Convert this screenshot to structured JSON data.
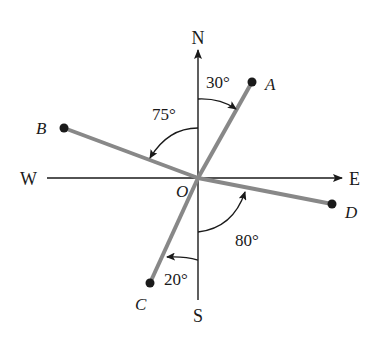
{
  "diagram": {
    "directions": {
      "north": "N",
      "south": "S",
      "east": "E",
      "west": "W"
    },
    "origin_label": "O",
    "points": [
      {
        "label": "A",
        "bearing": "N 30° E"
      },
      {
        "label": "B",
        "bearing": "N 75° W"
      },
      {
        "label": "C",
        "bearing": "S 20° W"
      },
      {
        "label": "D",
        "bearing": "S 80° E"
      }
    ],
    "angles": [
      {
        "id": "angle-a",
        "text": "30°"
      },
      {
        "id": "angle-b",
        "text": "75°"
      },
      {
        "id": "angle-c",
        "text": "20°"
      },
      {
        "id": "angle-d",
        "text": "80°"
      }
    ],
    "colors": {
      "axis": "#1a1a1a",
      "ray": "#888888",
      "point": "#1a1a1a"
    }
  }
}
